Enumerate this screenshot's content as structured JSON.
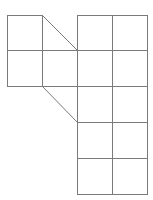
{
  "figure": {
    "stroke_color": "#7a7a7a",
    "background": "#ffffff",
    "cell_size": 35.5,
    "left_block": {
      "cols": 2,
      "rows": 2,
      "origin": [
        7,
        15
      ]
    },
    "right_block": {
      "cols": 2,
      "rows": 5,
      "origin": [
        77,
        15
      ]
    },
    "diagonals": [
      {
        "from": [
          42,
          15
        ],
        "to": [
          77,
          50
        ]
      },
      {
        "from": [
          42,
          86
        ],
        "to": [
          77,
          122
        ]
      }
    ]
  }
}
